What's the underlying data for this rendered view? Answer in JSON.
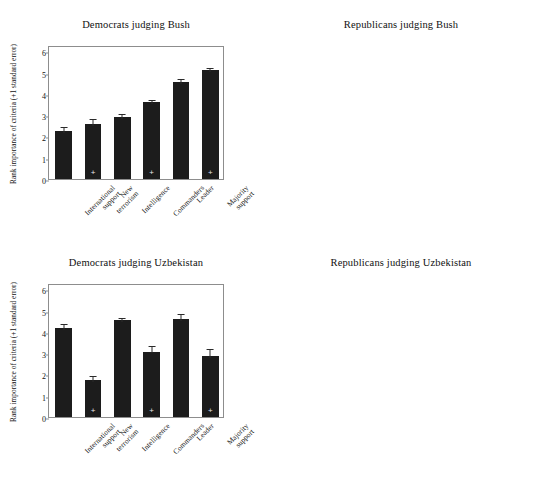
{
  "figure": {
    "panel_count": 4,
    "bar_color_dark": "#1c1c1c",
    "bar_color_light": "#bdbdbd"
  },
  "chart_data": [
    {
      "type": "bar",
      "panel": "top-left",
      "title": "Democrats judging Bush",
      "xlabel": "",
      "ylabel": "Rank importance of criteria (+1 standard error)",
      "ylim": [
        0,
        6.3
      ],
      "yticks": [
        0,
        1,
        2,
        3,
        4,
        5,
        6
      ],
      "grid": false,
      "legend": "none",
      "bar_style": "dark",
      "error_direction": "up",
      "categories": [
        "International support",
        "New terrorism",
        "Intelligence",
        "Commanders",
        "Leader",
        "Majority support"
      ],
      "values": [
        2.27,
        2.6,
        2.92,
        3.6,
        4.58,
        5.11
      ],
      "errors": [
        0.27,
        0.3,
        0.22,
        0.23,
        0.22,
        0.21
      ],
      "marked": [
        false,
        true,
        false,
        true,
        false,
        true
      ],
      "marker": "+"
    },
    {
      "type": "bar",
      "panel": "top-right",
      "title": "Republicans judging Bush",
      "xlabel": "",
      "ylabel": "Rank importance of criteria (+/-1 standard error)",
      "ylim": [
        0,
        6.3
      ],
      "yticks": [
        0,
        1,
        2,
        3,
        4,
        5,
        6
      ],
      "grid": false,
      "legend": "none",
      "bar_style": "light",
      "error_direction": "both",
      "categories": [
        "New terrorism",
        "Commanders",
        "Intelligence",
        "Majority support",
        "Leader",
        "International support"
      ],
      "values": [
        2.0,
        2.08,
        3.0,
        4.33,
        4.74,
        4.84
      ],
      "errors": [
        0.33,
        0.25,
        0.45,
        0.32,
        0.32,
        0.43
      ],
      "marked": [
        true,
        true,
        false,
        true,
        false,
        false
      ],
      "marker": "+"
    },
    {
      "type": "bar",
      "panel": "bottom-left",
      "title": "Democrats judging Uzbekistan",
      "xlabel": "",
      "ylabel": "Rank importance of criteria (+1 standard error)",
      "ylim": [
        0,
        6.3
      ],
      "yticks": [
        0,
        1,
        2,
        3,
        4,
        5,
        6
      ],
      "grid": false,
      "legend": "none",
      "bar_style": "dark",
      "error_direction": "up",
      "categories": [
        "International support",
        "New terrorism",
        "Intelligence",
        "Commanders",
        "Leader",
        "Majority support"
      ],
      "values": [
        4.2,
        1.74,
        4.54,
        3.08,
        4.61,
        2.88
      ],
      "errors": [
        0.27,
        0.28,
        0.23,
        0.36,
        0.33,
        0.39
      ],
      "marked": [
        false,
        true,
        false,
        true,
        false,
        true
      ],
      "marker": "+"
    },
    {
      "type": "bar",
      "panel": "bottom-right",
      "title": "Republicans judging Uzbekistan",
      "xlabel": "",
      "ylabel": "Rank importance of criteria (+/-1 standard error)",
      "ylim": [
        0,
        6.3
      ],
      "yticks": [
        0,
        1,
        2,
        3,
        4,
        5,
        6
      ],
      "grid": false,
      "legend": "none",
      "bar_style": "light",
      "error_direction": "both",
      "categories": [
        "New terrorism",
        "Commanders",
        "Intelligence",
        "Majority support",
        "Leader",
        "International support"
      ],
      "values": [
        1.55,
        1.99,
        3.85,
        4.29,
        3.43,
        5.87
      ],
      "errors": [
        0.44,
        0.31,
        0.37,
        0.48,
        0.48,
        0.12
      ],
      "marked": [
        true,
        true,
        false,
        true,
        false,
        false
      ],
      "marker": "+"
    }
  ]
}
